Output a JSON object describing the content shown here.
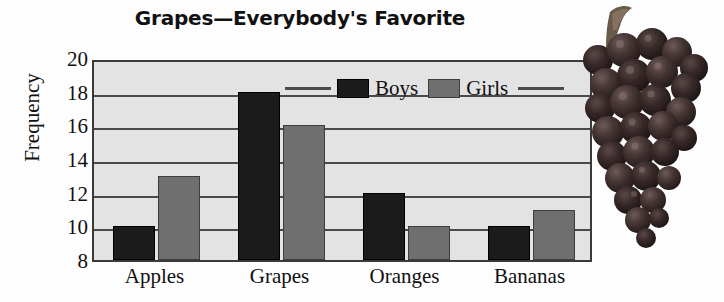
{
  "chart_data": {
    "type": "bar",
    "title": "Grapes—Everybody's Favorite",
    "xlabel": "",
    "ylabel": "Frequency",
    "categories": [
      "Apples",
      "Grapes",
      "Oranges",
      "Bananas"
    ],
    "series": [
      {
        "name": "Boys",
        "color": "#1b1b1b",
        "values": [
          10,
          18,
          12,
          10
        ]
      },
      {
        "name": "Girls",
        "color": "#6f6f6f",
        "values": [
          13,
          16,
          10,
          11
        ]
      }
    ],
    "ylim": [
      8,
      20
    ],
    "yticks": [
      8,
      10,
      12,
      14,
      16,
      18,
      20
    ],
    "ytick_step": 2,
    "grid": true,
    "legend_position": "top-center",
    "annotations": [
      "grape-cluster-photo"
    ]
  },
  "legend": {
    "boys_label": "Boys",
    "girls_label": "Girls"
  },
  "colors": {
    "boys": "#1b1b1b",
    "girls": "#6f6f6f",
    "plot_background": "#e3e3e3",
    "axis": "#3a3a3a",
    "grid": "#4a4a4a",
    "text": "#111111"
  },
  "image": {
    "grape_cluster_alt": "grape-cluster-photo"
  }
}
